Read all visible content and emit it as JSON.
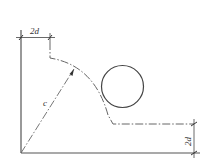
{
  "labels": {
    "top_dimension": "2d",
    "right_dimension": "2d",
    "radius": "c"
  },
  "colors": {
    "line": "#555555",
    "background": "#ffffff"
  }
}
